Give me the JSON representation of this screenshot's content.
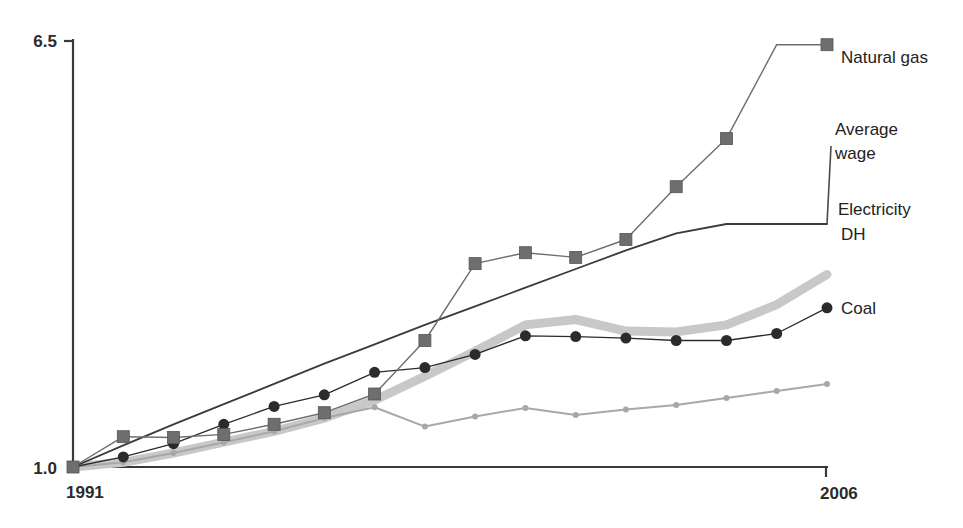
{
  "chart_data": {
    "type": "line",
    "title": "",
    "subtitle": "",
    "xlabel": "",
    "ylabel": "",
    "x": [
      1991,
      1992,
      1993,
      1994,
      1995,
      1996,
      1997,
      1998,
      1999,
      2000,
      2001,
      2002,
      2003,
      2004,
      2005,
      2006
    ],
    "xlim": [
      1991,
      2006
    ],
    "ylim": [
      1.0,
      6.5
    ],
    "x_tick_labels": [
      "1991",
      "2006"
    ],
    "y_tick_labels": [
      "1.0",
      "6.5"
    ],
    "grid": false,
    "legend_position": "right-inline-labels",
    "series": [
      {
        "name": "Natural gas",
        "label": "Natural gas",
        "color": "#6e6e6e",
        "marker": "square",
        "line_width": 1.4,
        "values": [
          1.0,
          1.39,
          1.38,
          1.42,
          1.55,
          1.7,
          1.94,
          2.63,
          3.62,
          3.76,
          3.7,
          3.93,
          4.61,
          5.23,
          6.44,
          6.44
        ]
      },
      {
        "name": "Average wage",
        "label": "Average wage",
        "color": "#3a3a3a",
        "marker": "none",
        "line_width": 1.8,
        "values": [
          1.0,
          1.28,
          1.55,
          1.81,
          2.07,
          2.33,
          2.58,
          2.83,
          3.07,
          3.31,
          3.55,
          3.79,
          4.01,
          4.13,
          4.13,
          4.13
        ]
      },
      {
        "name": "Electricity",
        "label": "Electricity",
        "color": "#c8c8c8",
        "marker": "none",
        "line_width": 9,
        "values": [
          1.0,
          1.06,
          1.18,
          1.32,
          1.46,
          1.63,
          1.86,
          2.17,
          2.49,
          2.83,
          2.9,
          2.75,
          2.74,
          2.83,
          3.09,
          3.48
        ]
      },
      {
        "name": "DH",
        "label": "DH",
        "color": "#2b2b2b",
        "marker": "circle",
        "line_width": 1.3,
        "values": [
          1.0,
          1.13,
          1.3,
          1.55,
          1.78,
          1.93,
          2.22,
          2.28,
          2.45,
          2.69,
          2.68,
          2.66,
          2.63,
          2.63,
          2.72,
          3.05
        ]
      },
      {
        "name": "Coal",
        "label": "Coal",
        "color": "#a8a8a8",
        "marker": "dot",
        "line_width": 2,
        "values": [
          1.0,
          1.06,
          1.18,
          1.32,
          1.46,
          1.63,
          1.77,
          1.52,
          1.65,
          1.76,
          1.67,
          1.74,
          1.8,
          1.89,
          1.98,
          2.07
        ]
      }
    ]
  },
  "axis": {
    "y_top_label": "6.5",
    "y_bottom_label": "1.0",
    "x_start_label": "1991",
    "x_end_label": "2006"
  },
  "labels": {
    "natural_gas": "Natural gas",
    "average_wage_line1": "Average",
    "average_wage_line2": "wage",
    "electricity": "Electricity",
    "dh": "DH",
    "coal": "Coal"
  },
  "colors": {
    "axis": "#3a3a3a",
    "natural_gas": "#6e6e6e",
    "average_wage": "#3a3a3a",
    "electricity": "#c8c8c8",
    "dh": "#2b2b2b",
    "coal": "#a8a8a8",
    "background": "#ffffff"
  }
}
